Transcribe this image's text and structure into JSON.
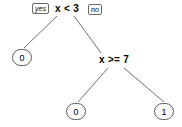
{
  "diagram": {
    "type": "decision-tree",
    "background_color": "#ffffff",
    "line_color": "#6f6f6f",
    "text_color": "#000000",
    "nodes": [
      {
        "id": "root",
        "kind": "condition",
        "label": "x < 3",
        "x": 55,
        "y": 3
      },
      {
        "id": "leaf-left",
        "kind": "leaf",
        "label": "0",
        "x": 12,
        "y": 49
      },
      {
        "id": "inner-right",
        "kind": "condition",
        "label": "x >= 7",
        "x": 99,
        "y": 54
      },
      {
        "id": "leaf-mid",
        "kind": "leaf",
        "label": "0",
        "x": 66,
        "y": 103
      },
      {
        "id": "leaf-right",
        "kind": "leaf",
        "label": "1",
        "x": 154,
        "y": 103
      }
    ],
    "edge_labels": [
      {
        "id": "yes-label",
        "text": "yes",
        "x": 32,
        "y": 3
      },
      {
        "id": "no-label",
        "text": "no",
        "x": 88,
        "y": 4
      }
    ],
    "edges": [
      {
        "from": "root",
        "to": "leaf-left",
        "branch": "yes",
        "x1": 57,
        "y1": 16,
        "x2": 24,
        "y2": 48
      },
      {
        "from": "root",
        "to": "inner-right",
        "branch": "no",
        "x1": 74,
        "y1": 16,
        "x2": 101,
        "y2": 53
      },
      {
        "from": "inner-right",
        "to": "leaf-mid",
        "branch": "yes",
        "x1": 108,
        "y1": 68,
        "x2": 78,
        "y2": 102
      },
      {
        "from": "inner-right",
        "to": "leaf-right",
        "branch": "no",
        "x1": 124,
        "y1": 68,
        "x2": 164,
        "y2": 102
      }
    ]
  }
}
